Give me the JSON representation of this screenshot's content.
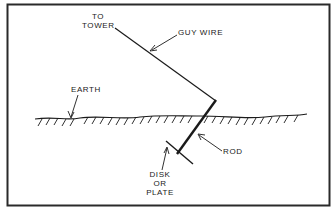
{
  "diagram": {
    "labels": {
      "to_tower_line1": "TO",
      "to_tower_line2": "TOWER",
      "guy_wire": "GUY WIRE",
      "earth": "EARTH",
      "rod": "ROD",
      "disk_line1": "DISK",
      "disk_line2": "OR",
      "disk_line3": "PLATE"
    },
    "colors": {
      "ink": "#1a1a1a",
      "background": "#ffffff",
      "border": "#2a2a2a"
    }
  }
}
